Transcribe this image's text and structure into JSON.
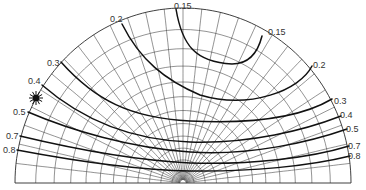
{
  "diagram": {
    "type": "sky-luminance-distribution",
    "geometry": {
      "cx": 183,
      "cy": 183,
      "rx": 168,
      "ry": 175
    },
    "grid": {
      "altitude_rings": 12,
      "azimuth_meridians": 28
    },
    "sun": {
      "x": 36,
      "y": 98,
      "label": "sun"
    },
    "isolines": [
      {
        "value": "0.15",
        "path": "M 176 9 C 182 45, 195 62, 232 64 C 250 64, 258 52, 262 36",
        "labels": [
          {
            "text": "0.15",
            "x": 174,
            "y": 9
          },
          {
            "text": "0.15",
            "x": 268,
            "y": 35
          }
        ]
      },
      {
        "value": "0.2",
        "path": "M 122 24 C 140 60, 165 80, 200 95 C 250 110, 300 90, 312 66",
        "labels": [
          {
            "text": "0.2",
            "x": 110,
            "y": 22
          },
          {
            "text": "0.2",
            "x": 313,
            "y": 68
          }
        ]
      },
      {
        "value": "0.3",
        "path": "M 61 62 C 95 100, 130 118, 190 121 C 250 124, 300 118, 332 99",
        "labels": [
          {
            "text": "0.3",
            "x": 47,
            "y": 66
          },
          {
            "text": "0.3",
            "x": 334,
            "y": 104
          }
        ]
      },
      {
        "value": "0.4",
        "path": "M 42 85 C 80 118, 130 140, 190 142 C 250 144, 305 130, 341 116",
        "labels": [
          {
            "text": "0.4",
            "x": 28,
            "y": 84
          },
          {
            "text": "0.4",
            "x": 340,
            "y": 118
          }
        ]
      },
      {
        "value": "0.5",
        "path": "M 28 112 C 70 130, 130 148, 190 152 C 250 156, 310 142, 347 129",
        "labels": [
          {
            "text": "0.5",
            "x": 13,
            "y": 115
          },
          {
            "text": "0.5",
            "x": 346,
            "y": 132
          }
        ]
      },
      {
        "value": "0.7",
        "path": "M 20 136 C 70 148, 130 160, 190 163 C 250 165, 310 158, 349 146",
        "labels": [
          {
            "text": "0.7",
            "x": 6,
            "y": 139
          },
          {
            "text": "0.7",
            "x": 348,
            "y": 149
          }
        ]
      },
      {
        "value": "0.8",
        "path": "M 17 150 C 70 160, 130 170, 190 171 C 250 172, 310 166, 350 156",
        "labels": [
          {
            "text": "0.8",
            "x": 3,
            "y": 153
          },
          {
            "text": "0.8",
            "x": 348,
            "y": 159
          }
        ]
      }
    ]
  }
}
